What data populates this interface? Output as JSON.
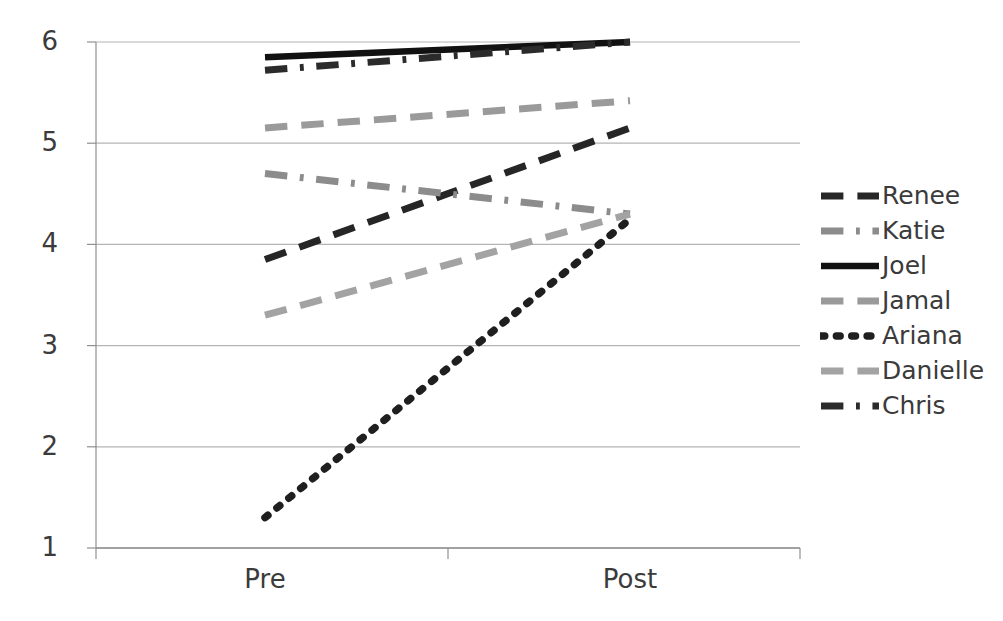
{
  "chart_data": {
    "type": "line",
    "title": "",
    "xlabel": "",
    "ylabel": "",
    "categories": [
      "Pre",
      "Post"
    ],
    "x_tick_labels": [
      "Pre",
      "Post"
    ],
    "y_tick_labels": [
      "1",
      "2",
      "3",
      "4",
      "5",
      "6"
    ],
    "y_ticks": [
      1,
      2,
      3,
      4,
      5,
      6
    ],
    "ylim": [
      1,
      6
    ],
    "grid": "horizontal",
    "legend_position": "right",
    "series": [
      {
        "name": "Renee",
        "values": [
          3.85,
          5.15
        ],
        "style": "dashed",
        "color": "#262626"
      },
      {
        "name": "Katie",
        "values": [
          4.7,
          4.3
        ],
        "style": "dashdot",
        "color": "#8c8c8c"
      },
      {
        "name": "Joel",
        "values": [
          5.85,
          6.0
        ],
        "style": "solid",
        "color": "#111111"
      },
      {
        "name": "Jamal",
        "values": [
          5.15,
          5.42
        ],
        "style": "dashed",
        "color": "#9a9a9a"
      },
      {
        "name": "Ariana",
        "values": [
          1.3,
          4.25
        ],
        "style": "dotted",
        "color": "#1f1f1f"
      },
      {
        "name": "Danielle",
        "values": [
          3.3,
          4.3
        ],
        "style": "dashed",
        "color": "#a3a3a3"
      },
      {
        "name": "Chris",
        "values": [
          5.72,
          6.0
        ],
        "style": "dashdot",
        "color": "#2b2b2b"
      }
    ]
  },
  "legend": {
    "items": [
      {
        "label": "Renee"
      },
      {
        "label": "Katie"
      },
      {
        "label": "Joel"
      },
      {
        "label": "Jamal"
      },
      {
        "label": "Ariana"
      },
      {
        "label": "Danielle"
      },
      {
        "label": "Chris"
      }
    ]
  },
  "colors": {
    "gridline": "#b4b4b4",
    "axis": "#8f8f8f",
    "tick_text": "#3b3b3b",
    "background": "#ffffff"
  }
}
